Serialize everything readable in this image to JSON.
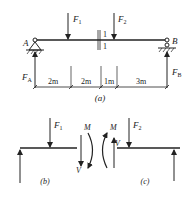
{
  "figure_a": {
    "caption": "(a)",
    "loads": [
      {
        "name": "F",
        "sub": "1"
      },
      {
        "name": "F",
        "sub": "2"
      }
    ],
    "supports": {
      "left": "A",
      "right": "B"
    },
    "reactions": [
      {
        "name": "F",
        "sub": "A"
      },
      {
        "name": "F",
        "sub": "B"
      }
    ],
    "section_labels": [
      "1",
      "1"
    ],
    "dimensions": [
      "2m",
      "2m",
      "1m",
      "3m"
    ]
  },
  "figure_b": {
    "caption": "(b)",
    "load": {
      "name": "F",
      "sub": "1"
    },
    "moment": "M",
    "shear": "V"
  },
  "figure_c": {
    "caption": "(c)",
    "load": {
      "name": "F",
      "sub": "2"
    },
    "moment": "M",
    "shear": "V"
  },
  "colors": {
    "ink": "#222222",
    "background": "#ffffff"
  }
}
